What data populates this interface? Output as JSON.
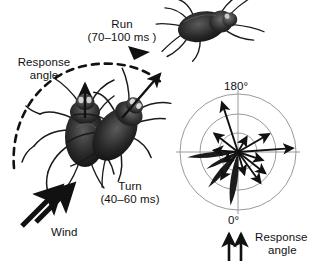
{
  "figure": {
    "title_present": false,
    "panels": [
      "escape-behavior-photo-diagram",
      "polar-response-angle-plot"
    ]
  },
  "left_panel": {
    "labels": {
      "response_angle_l1": "Response",
      "response_angle_l2": "angle",
      "run_l1": "Run",
      "run_l2": "(70–100 ms )",
      "turn_l1": "Turn",
      "turn_l2": "(40–60 ms)",
      "wind": "Wind"
    },
    "icons": {
      "wind_arrows": "double-thick-arrow-up-right",
      "run_arrow": "thin-arrow-up-right",
      "turn_arrow": "thin-arrow-up",
      "response_arc": "dashed-arc"
    },
    "specimens": [
      {
        "name": "cockroach-initial",
        "orientation": "facing-up"
      },
      {
        "name": "cockroach-turned",
        "orientation": "facing-up-right"
      },
      {
        "name": "cockroach-running",
        "orientation": "facing-right"
      }
    ]
  },
  "right_panel": {
    "labels": {
      "top_angle": "180°",
      "bottom_angle": "0°",
      "legend_l1": "Response",
      "legend_l2": "angle"
    },
    "icons": {
      "wind_arrows": "double-thin-arrow-up"
    }
  },
  "chart_data": {
    "type": "polar",
    "title": "",
    "xlabel": "",
    "ylabel": "",
    "angle_labels": {
      "top": "180°",
      "bottom": "0°"
    },
    "grid": true,
    "grid_circles": 3,
    "grid_radii": [
      0.33,
      0.66,
      1.0
    ],
    "axes_cross": true,
    "legend": "Response angle",
    "legend_position": "bottom-right",
    "angle_convention": "0 deg at bottom, 180 deg at top, measured counterclockwise",
    "petals": [
      {
        "angle_deg": 172,
        "length": 0.93,
        "width_deg": 13
      },
      {
        "angle_deg": 140,
        "length": 0.8,
        "width_deg": 12
      },
      {
        "angle_deg": 118,
        "length": 0.62,
        "width_deg": 11
      },
      {
        "angle_deg": 96,
        "length": 0.88,
        "width_deg": 10
      }
    ],
    "vectors": [
      {
        "angle_deg": 216,
        "length": 0.66
      },
      {
        "angle_deg": 232,
        "length": 0.6
      },
      {
        "angle_deg": 252,
        "length": 0.45
      },
      {
        "angle_deg": 274,
        "length": 0.95
      },
      {
        "angle_deg": 300,
        "length": 0.62
      },
      {
        "angle_deg": 330,
        "length": 0.3
      },
      {
        "angle_deg": 18,
        "length": 0.9
      },
      {
        "angle_deg": 52,
        "length": 0.52
      },
      {
        "angle_deg": 86,
        "length": 0.42
      },
      {
        "angle_deg": 124,
        "length": 0.3
      },
      {
        "angle_deg": 148,
        "length": 0.55
      },
      {
        "angle_deg": 196,
        "length": 0.4
      }
    ],
    "center": {
      "x": 238,
      "y": 152
    },
    "radius_px": 58
  },
  "colors": {
    "ink": "#111111",
    "grid": "#9a9a9a",
    "petal": "#1b1b1b",
    "background": "#ffffff"
  }
}
